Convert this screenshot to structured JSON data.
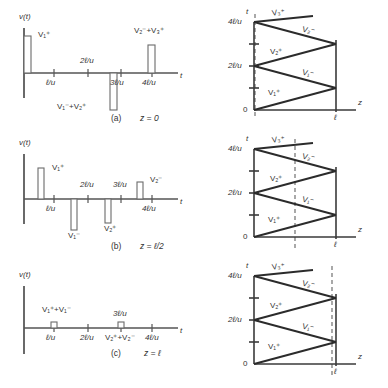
{
  "figure": {
    "type": "transmission-line-bounce-diagram-figure",
    "panels": [
      {
        "id": "a",
        "caption_label": "(a)",
        "caption_condition": "z = 0",
        "waveform": {
          "y_axis_label": "v(t)",
          "x_axis_label": "t",
          "ticks": [
            "ℓ/u",
            "2ℓ/u",
            "3ℓ/u",
            "4ℓ/u"
          ],
          "pulses": [
            {
              "time": "0",
              "polarity": "up",
              "label": "V₁⁺"
            },
            {
              "time": "2ℓ/u",
              "polarity": "down",
              "label": "V₁⁻+V₂⁺"
            },
            {
              "time": "4ℓ/u",
              "polarity": "up",
              "label": "V₂⁻+V₃⁺"
            }
          ]
        },
        "bounce": {
          "t_axis_label": "t",
          "z_axis_label": "z",
          "origin_label": "0",
          "z_end_label": "ℓ",
          "t_ticks": [
            "2ℓ/u",
            "4ℓ/u"
          ],
          "wave_labels": [
            "V₁⁺",
            "V₁⁻",
            "V₂⁺",
            "V₂⁻",
            "V₃⁺"
          ],
          "observation_line_z": "0"
        }
      },
      {
        "id": "b",
        "caption_label": "(b)",
        "caption_condition": "z = ℓ/2",
        "waveform": {
          "y_axis_label": "v(t)",
          "x_axis_label": "t",
          "ticks": [
            "ℓ/u",
            "2ℓ/u",
            "3ℓ/u",
            "4ℓ/u"
          ],
          "pulses": [
            {
              "time": "ℓ/2u",
              "polarity": "up",
              "label": "V₁⁺"
            },
            {
              "time": "3ℓ/2u",
              "polarity": "down",
              "label": "V₁⁻"
            },
            {
              "time": "5ℓ/2u",
              "polarity": "down",
              "label": "V₂⁺"
            },
            {
              "time": "7ℓ/2u",
              "polarity": "up",
              "label": "V₂⁻"
            }
          ]
        },
        "bounce": {
          "t_axis_label": "t",
          "z_axis_label": "z",
          "origin_label": "0",
          "z_end_label": "ℓ",
          "t_ticks": [
            "2ℓ/u",
            "4ℓ/u"
          ],
          "wave_labels": [
            "V₁⁺",
            "V₁⁻",
            "V₂⁺",
            "V₂⁻",
            "V₃⁺"
          ],
          "observation_line_z": "ℓ/2"
        }
      },
      {
        "id": "c",
        "caption_label": "(c)",
        "caption_condition": "z = ℓ",
        "waveform": {
          "y_axis_label": "v(t)",
          "x_axis_label": "t",
          "ticks": [
            "ℓ/u",
            "2ℓ/u",
            "3ℓ/u",
            "4ℓ/u"
          ],
          "pulses": [
            {
              "time": "ℓ/u",
              "polarity": "up",
              "label": "V₁⁺+V₁⁻"
            },
            {
              "time": "3ℓ/u",
              "polarity": "up",
              "label": "V₂⁺+V₂⁻"
            }
          ]
        },
        "bounce": {
          "t_axis_label": "t",
          "z_axis_label": "z",
          "origin_label": "0",
          "z_end_label": "ℓ",
          "t_ticks": [
            "2ℓ/u",
            "4ℓ/u"
          ],
          "wave_labels": [
            "V₁⁺",
            "V₁⁻",
            "V₂⁺",
            "V₂⁻",
            "V₃⁺"
          ],
          "observation_line_z": "ℓ"
        }
      }
    ]
  },
  "colors": {
    "background": "#ffffff",
    "axis": "#555555",
    "zigzag": "#2b2b2b",
    "dashed_marker": "#9a9a9a",
    "text": "#333333"
  }
}
